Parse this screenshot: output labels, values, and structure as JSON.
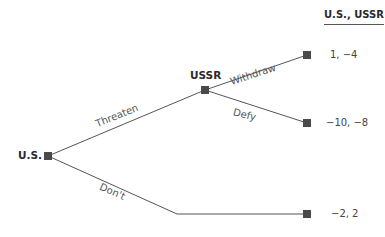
{
  "header": {
    "label": "U.S., USSR"
  },
  "players": {
    "us": "U.S.",
    "ussr": "USSR"
  },
  "actions": {
    "threaten": "Threaten",
    "dont": "Don't",
    "withdraw": "Withdraw",
    "defy": "Defy"
  },
  "payoffs": {
    "withdraw": "1, −4",
    "defy": "−10, −8",
    "dont": "−2, 2"
  },
  "colors": {
    "line": "#555555",
    "node": "#4a4a4a"
  }
}
